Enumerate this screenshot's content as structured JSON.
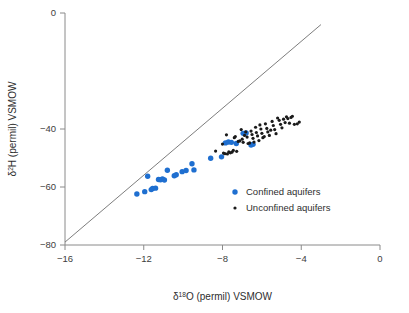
{
  "chart_data": {
    "type": "scatter",
    "title": "",
    "xlabel": "δ¹⁸O (permil) VSMOW",
    "ylabel": "δ²H (permil) VSMOW",
    "xlim": [
      -16,
      0
    ],
    "ylim": [
      -80,
      0
    ],
    "xticks": [
      -16,
      -12,
      -8,
      -4,
      0
    ],
    "xticklabels": [
      "−16",
      "−12",
      "−8",
      "−4",
      "0"
    ],
    "yticks": [
      0,
      -40,
      -60,
      -80
    ],
    "yticklabels": [
      "0",
      "−40",
      "−60",
      "−80"
    ],
    "grid": false,
    "legend_position": "center-right-inside",
    "reference_line": {
      "name": "global-meteoric-water-line",
      "x": [
        -16.0,
        -3.0
      ],
      "y": [
        -79.0,
        -4.0
      ],
      "color": "#6e6e6e"
    },
    "series": [
      {
        "name": "Confined aquifers",
        "marker": "circle",
        "color": "#1f6fd0",
        "size": 5.4,
        "points": [
          [
            -12.35,
            -62.4
          ],
          [
            -11.95,
            -61.6
          ],
          [
            -11.8,
            -56.3
          ],
          [
            -11.62,
            -60.9
          ],
          [
            -11.55,
            -60.5
          ],
          [
            -11.4,
            -60.4
          ],
          [
            -11.25,
            -57.4
          ],
          [
            -11.15,
            -57.5
          ],
          [
            -11.05,
            -57.2
          ],
          [
            -10.95,
            -57.6
          ],
          [
            -10.8,
            -54.2
          ],
          [
            -10.45,
            -56.1
          ],
          [
            -10.35,
            -55.8
          ],
          [
            -10.05,
            -54.7
          ],
          [
            -9.85,
            -54.3
          ],
          [
            -9.55,
            -52.0
          ],
          [
            -9.45,
            -54.1
          ],
          [
            -8.6,
            -50.1
          ],
          [
            -8.05,
            -49.6
          ],
          [
            -7.85,
            -44.8
          ],
          [
            -7.7,
            -44.5
          ],
          [
            -7.55,
            -44.6
          ],
          [
            -7.3,
            -45.0
          ],
          [
            -6.95,
            -41.5
          ],
          [
            -6.8,
            -41.4
          ],
          [
            -6.55,
            -45.5
          ],
          [
            -6.45,
            -45.3
          ]
        ]
      },
      {
        "name": "Unconfined aquifers",
        "marker": "circle",
        "color": "#1a1a1a",
        "size": 3.2,
        "points": [
          [
            -8.35,
            -47.6
          ],
          [
            -8.0,
            -45.2
          ],
          [
            -7.95,
            -48.3
          ],
          [
            -7.88,
            -48.5
          ],
          [
            -7.8,
            -42.0
          ],
          [
            -7.75,
            -48.6
          ],
          [
            -7.68,
            -47.9
          ],
          [
            -7.6,
            -48.2
          ],
          [
            -7.52,
            -48.0
          ],
          [
            -7.45,
            -47.4
          ],
          [
            -7.4,
            -43.0
          ],
          [
            -7.35,
            -42.6
          ],
          [
            -7.28,
            -47.7
          ],
          [
            -7.2,
            -44.3
          ],
          [
            -7.12,
            -44.1
          ],
          [
            -7.05,
            -40.2
          ],
          [
            -7.0,
            -43.5
          ],
          [
            -6.95,
            -44.6
          ],
          [
            -6.88,
            -42.2
          ],
          [
            -6.82,
            -41.0
          ],
          [
            -6.75,
            -42.8
          ],
          [
            -6.7,
            -45.0
          ],
          [
            -6.62,
            -44.8
          ],
          [
            -6.55,
            -40.7
          ],
          [
            -6.5,
            -41.9
          ],
          [
            -6.45,
            -43.2
          ],
          [
            -6.4,
            -44.5
          ],
          [
            -6.32,
            -39.4
          ],
          [
            -6.28,
            -41.2
          ],
          [
            -6.22,
            -42.4
          ],
          [
            -6.15,
            -44.0
          ],
          [
            -6.1,
            -38.6
          ],
          [
            -6.05,
            -40.0
          ],
          [
            -6.0,
            -41.5
          ],
          [
            -5.95,
            -43.0
          ],
          [
            -5.88,
            -42.6
          ],
          [
            -5.82,
            -38.2
          ],
          [
            -5.75,
            -39.8
          ],
          [
            -5.7,
            -41.0
          ],
          [
            -5.62,
            -42.2
          ],
          [
            -5.55,
            -40.4
          ],
          [
            -5.48,
            -37.4
          ],
          [
            -5.42,
            -38.8
          ],
          [
            -5.35,
            -40.2
          ],
          [
            -5.28,
            -41.6
          ],
          [
            -5.2,
            -36.2
          ],
          [
            -5.12,
            -37.0
          ],
          [
            -5.05,
            -38.4
          ],
          [
            -4.98,
            -39.6
          ],
          [
            -4.9,
            -36.6
          ],
          [
            -4.82,
            -37.8
          ],
          [
            -4.75,
            -35.8
          ],
          [
            -4.68,
            -36.4
          ],
          [
            -4.6,
            -38.0
          ],
          [
            -4.52,
            -36.0
          ],
          [
            -4.45,
            -35.6
          ],
          [
            -4.35,
            -38.4
          ],
          [
            -4.2,
            -38.2
          ],
          [
            -4.1,
            -37.6
          ]
        ]
      }
    ]
  },
  "legend": {
    "items": [
      {
        "label": "Confined aquifers",
        "color": "#1f6fd0",
        "size": 5.4
      },
      {
        "label": "Unconfined aquifers",
        "color": "#1a1a1a",
        "size": 3.2
      }
    ]
  },
  "axes": {
    "x_title_parts": {
      "delta": "δ",
      "sup": "18",
      "rest": "O (permil) VSMOW"
    },
    "y_title_parts": {
      "delta": "δ",
      "sup": "2",
      "rest": "H (permil) VSMOW"
    }
  }
}
